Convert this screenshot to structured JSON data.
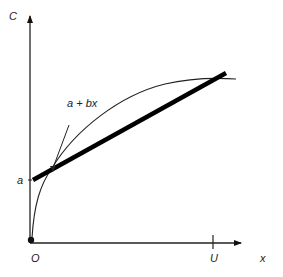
{
  "diagram": {
    "axes": {
      "y_label": "C",
      "x_label": "x",
      "origin_label": "O"
    },
    "ticks": {
      "y_intercept_label": "a",
      "x_mark_label": "U"
    },
    "annotations": {
      "line_label": "a + bx"
    },
    "elements": [
      {
        "type": "curve",
        "description": "concave increasing cost curve starting at origin, flattening near U"
      },
      {
        "type": "line",
        "description": "thick straight line a + bx starting at intercept a"
      }
    ],
    "colors": {
      "ink": "#111111"
    }
  }
}
